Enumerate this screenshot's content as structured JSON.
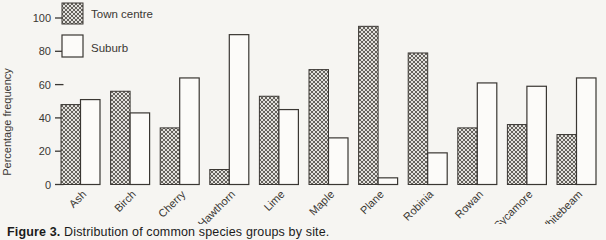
{
  "figure": {
    "caption_label": "Figure 3.",
    "caption_text": " Distribution of common species groups by site."
  },
  "chart_data": {
    "type": "bar",
    "title": "",
    "ylabel": "Percentage frequency",
    "xlabel": "",
    "ylim": [
      0,
      100
    ],
    "yticks": [
      0,
      20,
      40,
      60,
      80,
      100
    ],
    "grid": false,
    "legend_position": "top-left",
    "categories": [
      "Ash",
      "Birch",
      "Cherry",
      "Hawthorn",
      "Lime",
      "Maple",
      "Plane",
      "Robinia",
      "Rowan",
      "Sycamore",
      "Whitebeam"
    ],
    "series": [
      {
        "name": "Town centre",
        "style": "hatched",
        "values": [
          48,
          56,
          34,
          9,
          53,
          69,
          95,
          79,
          34,
          36,
          30
        ]
      },
      {
        "name": "Suburb",
        "style": "open",
        "values": [
          51,
          43,
          64,
          90,
          45,
          28,
          4,
          19,
          61,
          59,
          64
        ]
      }
    ],
    "colors": {
      "ink": "#3a3733",
      "hatch_fill": "#e3e1dd",
      "hatch_line": "#57534e",
      "suburb_fill": "#fcfbf9",
      "background": "#f6f5f2"
    }
  }
}
